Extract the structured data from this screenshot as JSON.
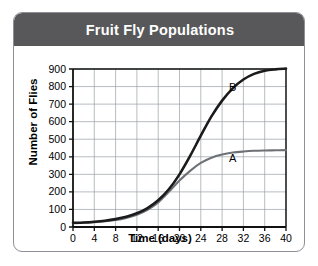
{
  "card": {
    "title": "Fruit Fly Populations"
  },
  "chart_data": {
    "type": "line",
    "title": "Fruit Fly Populations",
    "xlabel": "Time (days)",
    "ylabel": "Number of Flies",
    "xlim": [
      0,
      40
    ],
    "ylim": [
      0,
      900
    ],
    "xticks": [
      0,
      4,
      8,
      12,
      16,
      20,
      24,
      28,
      32,
      36,
      40
    ],
    "yticks": [
      0,
      100,
      200,
      300,
      400,
      500,
      600,
      700,
      800,
      900
    ],
    "grid": true,
    "legend": "inline-curve-labels",
    "series": [
      {
        "name": "A",
        "color": "#6e7277",
        "label_x": 30,
        "label_y": 370,
        "x": [
          0,
          2,
          4,
          6,
          8,
          10,
          12,
          14,
          16,
          18,
          20,
          22,
          24,
          26,
          28,
          30,
          32,
          34,
          36,
          38,
          40
        ],
        "values": [
          22,
          24,
          28,
          33,
          40,
          52,
          70,
          98,
          140,
          200,
          265,
          320,
          365,
          395,
          413,
          424,
          430,
          434,
          436,
          437,
          438
        ]
      },
      {
        "name": "B",
        "color": "#1b1b1b",
        "label_x": 30,
        "label_y": 775,
        "x": [
          0,
          2,
          4,
          6,
          8,
          10,
          12,
          14,
          16,
          18,
          20,
          22,
          24,
          26,
          28,
          30,
          32,
          34,
          36,
          38,
          40
        ],
        "values": [
          24,
          26,
          30,
          36,
          45,
          58,
          78,
          108,
          152,
          215,
          300,
          405,
          520,
          630,
          720,
          790,
          840,
          872,
          890,
          898,
          902
        ]
      }
    ],
    "annotations": [
      "A",
      "B"
    ]
  },
  "colors": {
    "titlebar": "#58585a",
    "title_text": "#ffffff",
    "axis": "#111111",
    "grid": "#9aa0a6",
    "curve_a": "#6e7277",
    "curve_b": "#1b1b1b",
    "card_border": "#8d9096"
  }
}
